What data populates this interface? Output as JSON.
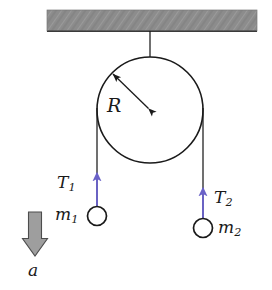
{
  "figure": {
    "background_color": "#ffffff"
  },
  "ceiling": {
    "name": "ceiling-support-bar",
    "fill_color": "#8c8c8c",
    "edge_color": "#1a1a1a",
    "x": 47,
    "y": 10,
    "width": 210,
    "height": 21
  },
  "pulley": {
    "name": "pulley-wheel",
    "center_x": 150,
    "center_y": 110,
    "radius": 53,
    "stroke_color": "#1a1a1a",
    "fill_color": "#ffffff"
  },
  "support_cord": {
    "name": "support-cord",
    "stroke_color": "#1a1a1a",
    "x": 150,
    "y_top": 31,
    "y_bottom": 110
  },
  "radius_arrow": {
    "name": "radius-dimension-arrow",
    "label": "R",
    "stroke_color": "#1a1a1a",
    "from_x": 150,
    "from_y": 110,
    "to_x": 112,
    "to_y": 73,
    "double_headed": true
  },
  "left_side": {
    "cord": {
      "name": "left-cord",
      "x": 97,
      "y_top": 110,
      "y_bottom": 205,
      "stroke_color": "#1a1a1a"
    },
    "tension_arrow": {
      "name": "tension-arrow-left",
      "label": "T",
      "subscript": "1",
      "color": "#6a62c8",
      "x": 97,
      "y_tail": 210,
      "y_head": 171
    },
    "mass": {
      "name": "mass-left",
      "label": "m",
      "subscript": "1",
      "center_x": 97,
      "center_y": 216,
      "radius": 10,
      "stroke_color": "#1a1a1a",
      "fill_color": "#ffffff"
    }
  },
  "right_side": {
    "cord": {
      "name": "right-cord",
      "x": 203,
      "y_top": 110,
      "y_bottom": 218,
      "stroke_color": "#1a1a1a"
    },
    "tension_arrow": {
      "name": "tension-arrow-right",
      "label": "T",
      "subscript": "2",
      "color": "#6a62c8",
      "x": 203,
      "y_tail": 222,
      "y_head": 186
    },
    "mass": {
      "name": "mass-right",
      "label": "m",
      "subscript": "2",
      "center_x": 203,
      "center_y": 228,
      "radius": 10,
      "stroke_color": "#1a1a1a",
      "fill_color": "#ffffff"
    }
  },
  "acceleration": {
    "name": "acceleration-block-arrow",
    "label": "a",
    "direction": "down",
    "fill_color": "#9e9e9e",
    "edge_color": "#4d4d4d",
    "center_x": 35,
    "y_top": 212,
    "y_bottom": 256,
    "shaft_width": 13,
    "head_width": 25
  },
  "labels": {
    "radius": "R",
    "tension_left_base": "T",
    "tension_left_sub": "1",
    "mass_left_base": "m",
    "mass_left_sub": "1",
    "tension_right_base": "T",
    "tension_right_sub": "2",
    "mass_right_base": "m",
    "mass_right_sub": "2",
    "acceleration": "a"
  }
}
